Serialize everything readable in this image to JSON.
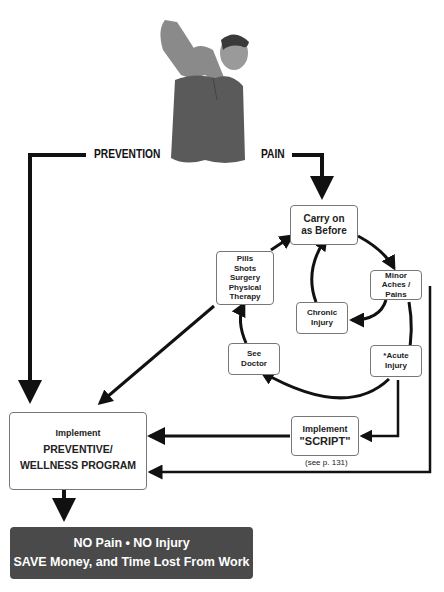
{
  "labels": {
    "prevention": "PREVENTION",
    "pain": "PAIN"
  },
  "nodes": {
    "carry_on": [
      "Carry on",
      "as Before"
    ],
    "pills": [
      "Pills",
      "Shots",
      "Surgery",
      "Physical Therapy"
    ],
    "minor": [
      "Minor",
      "Aches / Pains"
    ],
    "chronic": [
      "Chronic",
      "Injury"
    ],
    "see_doctor": [
      "See",
      "Doctor"
    ],
    "acute": [
      "*Acute",
      "Injury"
    ],
    "script": [
      "Implement",
      "\"SCRIPT\""
    ],
    "script_note": "(see p. 131)",
    "wellness": [
      "Implement",
      "PREVENTIVE/",
      "WELLNESS PROGRAM"
    ]
  },
  "result": {
    "line1": "NO Pain • NO Injury",
    "line2": "SAVE Money, and Time Lost From Work"
  },
  "image": {
    "description": "man holding neck in pain"
  },
  "colors": {
    "line": "#111111",
    "result_bg": "#4a4a4a",
    "box_border": "#777777"
  }
}
